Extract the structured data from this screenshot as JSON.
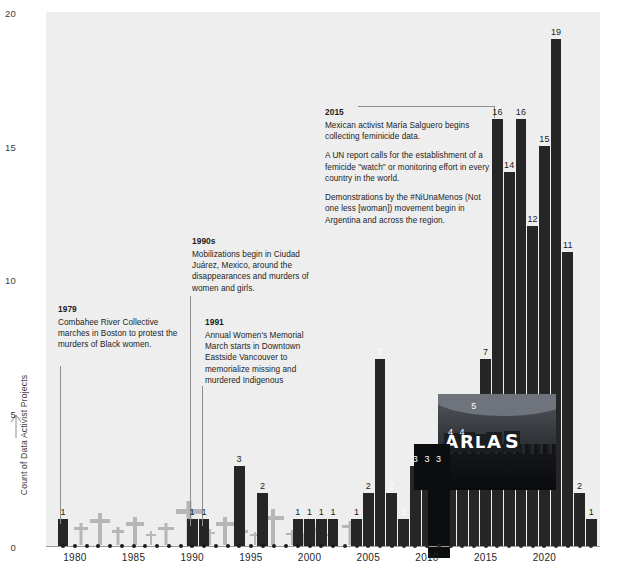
{
  "figure": {
    "y_axis_title": "Count of Data Activist Projects",
    "y_ticks": [
      "0",
      "5",
      "10",
      "15",
      "20"
    ],
    "x_ticks": [
      "1980",
      "1985",
      "1990",
      "1995",
      "2000",
      "2005",
      "2010",
      "2015",
      "2020"
    ],
    "plot_bg_color": "#eeeeee",
    "bar_color": "#262626",
    "top_cut_text": ""
  },
  "annotations": [
    {
      "id": "ann-1979",
      "year": "1979",
      "paragraphs": [
        "Combahee River Collective marches in Boston to protest the murders of Black women."
      ]
    },
    {
      "id": "ann-1990s",
      "year": "1990s",
      "paragraphs": [
        "Mobilizations begin in Ciudad Juárez, Mexico, around the disappearances and murders of women and girls."
      ]
    },
    {
      "id": "ann-1991",
      "year": "1991",
      "paragraphs": [
        "Annual Women's Memorial March starts in Downtown Eastside Vancouver to memorialize missing and murdered Indigenous"
      ]
    },
    {
      "id": "ann-2015",
      "year": "2015",
      "paragraphs": [
        "Mexican activist María Salguero begins collecting feminicide data.",
        "A UN report calls for the establishment of a femicide \"watch\" or monitoring effort in every country in the world.",
        "Demonstrations by the #NiUnaMenos (Not one less [woman]) movement begin in Argentina and across the region."
      ]
    }
  ],
  "photo": {
    "banner_text": "ARLA S",
    "caption": ""
  },
  "chart_data": {
    "type": "bar",
    "title": "",
    "xlabel": "",
    "ylabel": "Count of Data Activist Projects",
    "ylim": [
      0,
      20
    ],
    "xlim": [
      1978,
      2025
    ],
    "grid": false,
    "legend": null,
    "categories": [
      "1979",
      "1980",
      "1981",
      "1982",
      "1983",
      "1984",
      "1985",
      "1986",
      "1987",
      "1988",
      "1989",
      "1990",
      "1991",
      "1992",
      "1993",
      "1994",
      "1995",
      "1996",
      "1997",
      "1998",
      "1999",
      "2000",
      "2001",
      "2002",
      "2003",
      "2004",
      "2005",
      "2006",
      "2007",
      "2008",
      "2009",
      "2010",
      "2011",
      "2012",
      "2013",
      "2014",
      "2015",
      "2016",
      "2017",
      "2018",
      "2019",
      "2020",
      "2021",
      "2022",
      "2023",
      "2024"
    ],
    "values": [
      1,
      0,
      0,
      0,
      0,
      0,
      0,
      0,
      0,
      0,
      0,
      1,
      1,
      0,
      0,
      3,
      0,
      2,
      0,
      0,
      1,
      1,
      1,
      1,
      0,
      1,
      2,
      7,
      2,
      1,
      3,
      3,
      3,
      4,
      4,
      5,
      7,
      16,
      14,
      16,
      12,
      15,
      19,
      11,
      2,
      1
    ],
    "bar_labels": [
      "1",
      "",
      "",
      "",
      "",
      "",
      "",
      "",
      "",
      "",
      "",
      "1",
      "1",
      "",
      "",
      "3",
      "",
      "2",
      "",
      "",
      "1",
      "1",
      "1",
      "1",
      "",
      "1",
      "2",
      "7",
      "2",
      "1",
      "3",
      "3",
      "3",
      "4",
      "4",
      "5",
      "7",
      "16",
      "14",
      "16",
      "12",
      "15",
      "19",
      "11",
      "2",
      "1"
    ]
  }
}
